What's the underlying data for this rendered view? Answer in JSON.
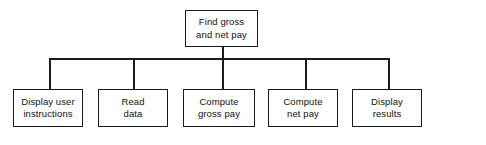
{
  "diagram": {
    "type": "hierarchy-structure-chart",
    "background_color": "#ffffff",
    "line_color": "#1b1b1b",
    "text_color": "#111111",
    "root": {
      "id": "root",
      "label": "Find gross\nand net pay",
      "x": 185,
      "y": 10,
      "width": 73,
      "height": 37
    },
    "children": [
      {
        "id": "child-1",
        "label": "Display user\ninstructions",
        "x": 13,
        "y": 89,
        "width": 70,
        "height": 38,
        "stem_x": 49
      },
      {
        "id": "child-2",
        "label": "Read\ndata",
        "x": 98,
        "y": 89,
        "width": 70,
        "height": 38,
        "stem_x": 133
      },
      {
        "id": "child-3",
        "label": "Compute\ngross pay",
        "x": 183,
        "y": 89,
        "width": 72,
        "height": 38,
        "stem_x": 222
      },
      {
        "id": "child-4",
        "label": "Compute\nnet pay",
        "x": 268,
        "y": 89,
        "width": 70,
        "height": 38,
        "stem_x": 305
      },
      {
        "id": "child-5",
        "label": "Display\nresults",
        "x": 352,
        "y": 89,
        "width": 70,
        "height": 38,
        "stem_x": 388
      }
    ],
    "bus": {
      "y": 58,
      "x_start": 49,
      "x_end": 388,
      "root_stem_x": 222,
      "root_stem_top": 47
    }
  },
  "chart_data": {
    "type": "table",
    "title": "Find gross and net pay",
    "levels": [
      {
        "level": 0,
        "nodes": [
          "Find gross and net pay"
        ]
      },
      {
        "level": 1,
        "nodes": [
          "Display user instructions",
          "Read data",
          "Compute gross pay",
          "Compute net pay",
          "Display results"
        ]
      }
    ],
    "edges": [
      {
        "from": "Find gross and net pay",
        "to": "Display user instructions"
      },
      {
        "from": "Find gross and net pay",
        "to": "Read data"
      },
      {
        "from": "Find gross and net pay",
        "to": "Compute gross pay"
      },
      {
        "from": "Find gross and net pay",
        "to": "Compute net pay"
      },
      {
        "from": "Find gross and net pay",
        "to": "Display results"
      }
    ]
  }
}
